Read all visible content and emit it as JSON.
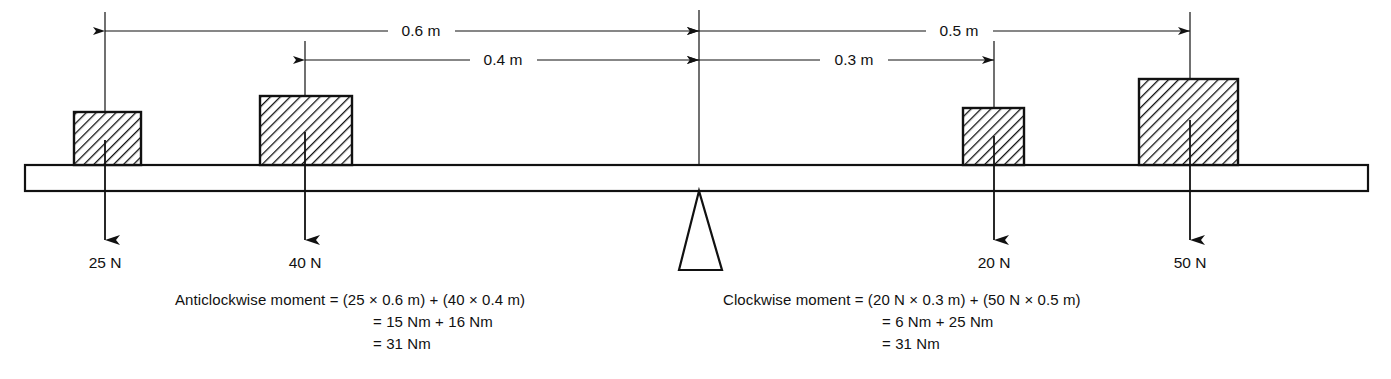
{
  "figure": {
    "beam": {
      "label": "beam"
    },
    "pivot": {
      "label": "fulcrum"
    }
  },
  "dimensions": [
    {
      "id": "d06",
      "label": "0.6 m",
      "label_x": 700,
      "label_y": 36,
      "line_y": 31,
      "x1": 105,
      "x2": 699,
      "side": "left"
    },
    {
      "id": "d04",
      "label": "0.4 m",
      "label_x": 538,
      "label_y": 65,
      "line_y": 60,
      "x1": 305,
      "x2": 699,
      "side": "left"
    },
    {
      "id": "d05",
      "label": "0.5 m",
      "label_x": 963,
      "label_y": 36,
      "line_y": 31,
      "x1": 699,
      "x2": 1190,
      "side": "right"
    },
    {
      "id": "d03",
      "label": "0.3 m",
      "label_x": 857,
      "label_y": 65,
      "line_y": 60,
      "x1": 699,
      "x2": 994,
      "side": "right"
    }
  ],
  "blocks": [
    {
      "id": "b25",
      "force": "25 N",
      "x": 74,
      "y": 112,
      "w": 67,
      "h": 53,
      "arrow_x": 105,
      "label_x": 105,
      "label_y": 268
    },
    {
      "id": "b40",
      "force": "40 N",
      "x": 260,
      "y": 96,
      "w": 92,
      "h": 69,
      "arrow_x": 305,
      "label_x": 305,
      "label_y": 268
    },
    {
      "id": "b20",
      "force": "20 N",
      "x": 963,
      "y": 108,
      "w": 61,
      "h": 57,
      "arrow_x": 994,
      "label_x": 994,
      "label_y": 268
    },
    {
      "id": "b50",
      "force": "50 N",
      "x": 1139,
      "y": 79,
      "w": 99,
      "h": 86,
      "arrow_x": 1190,
      "label_x": 1190,
      "label_y": 268
    }
  ],
  "calculations": {
    "anticlockwise": {
      "name": "anticlockwise-moment-calculation",
      "x": 175,
      "lines": [
        {
          "text": "Anticlockwise moment = (25 × 0.6 m) + (40 × 0.4 m)",
          "x": 175,
          "y": 305
        },
        {
          "text": "= 15 Nm + 16 Nm",
          "x": 373,
          "y": 327
        },
        {
          "text": "= 31 Nm",
          "x": 373,
          "y": 349
        }
      ]
    },
    "clockwise": {
      "name": "clockwise-moment-calculation",
      "x": 723,
      "lines": [
        {
          "text": "Clockwise moment = (20 N × 0.3 m) + (50 N × 0.5 m)",
          "x": 723,
          "y": 305
        },
        {
          "text": "= 6 Nm + 25 Nm",
          "x": 882,
          "y": 327
        },
        {
          "text": "= 31 Nm",
          "x": 882,
          "y": 349
        }
      ]
    }
  },
  "colors": {
    "ink": "#111111",
    "paper": "#ffffff"
  }
}
